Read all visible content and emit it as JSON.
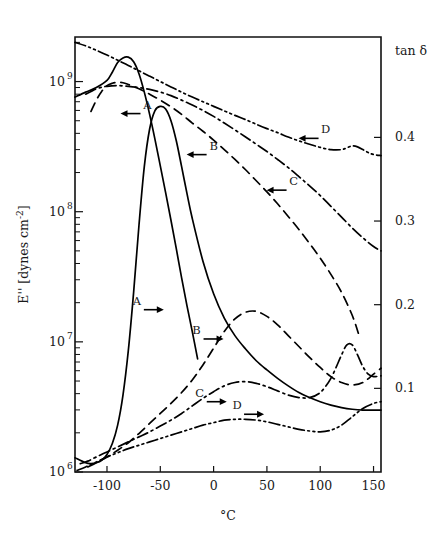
{
  "figure": {
    "background_color": "#ffffff",
    "line_color": "#000000",
    "frame": {
      "left": 75,
      "top": 37,
      "right": 381,
      "bottom": 472
    }
  },
  "chart_data": {
    "type": "line",
    "title": "",
    "subtitle": "",
    "xlabel": "°C",
    "ylabel": "E'' [dynes cm⁻²]",
    "y2label": "tan δ",
    "grid": false,
    "legend_position": "inline-labels-with-arrows",
    "xlim": [
      -130,
      157
    ],
    "xticks": [
      -100,
      -50,
      0,
      50,
      100,
      150
    ],
    "xticklabels": [
      "-100",
      "-50",
      "0",
      "50",
      "100",
      "150"
    ],
    "yscale": "log",
    "ylim": [
      1000000,
      2200000000
    ],
    "yticks": [
      1000000,
      10000000,
      100000000,
      1000000000
    ],
    "yticklabels": [
      "10⁶",
      "10⁷",
      "10⁸",
      "10⁹"
    ],
    "ytick_mantissas": [
      "10",
      "10",
      "10",
      "10"
    ],
    "ytick_exponents": [
      "6",
      "7",
      "8",
      "9"
    ],
    "y2lim": [
      0.0,
      0.52
    ],
    "y2ticks": [
      0.1,
      0.2,
      0.3,
      0.4
    ],
    "y2ticklabels": [
      "0.1",
      "0.2",
      "0.3",
      "0.4"
    ],
    "axis_assignment_note": "Upper set of four curves = E'' (left log axis, arrows point left). Lower set of four curves = tan δ (right linear axis, arrows point right).",
    "series": [
      {
        "name": "A",
        "label": "A",
        "axis": "left",
        "quantity": "E''",
        "linestyle": "solid",
        "arrow_direction": "left",
        "label_position": {
          "x": -62,
          "y": 620000000
        },
        "x": [
          -130,
          -120,
          -110,
          -100,
          -95,
          -90,
          -85,
          -80,
          -75,
          -70,
          -65,
          -60,
          -55,
          -50,
          -45,
          -40,
          -35,
          -30,
          -25,
          -20,
          -15
        ],
        "y": [
          760000000,
          830000000,
          900000000,
          1020000000,
          1180000000,
          1400000000,
          1520000000,
          1540000000,
          1420000000,
          1150000000,
          830000000,
          560000000,
          360000000,
          225000000,
          140000000,
          86000000,
          52000000,
          31000000,
          19000000,
          12000000,
          7400000
        ]
      },
      {
        "name": "B",
        "label": "B",
        "axis": "left",
        "quantity": "E''",
        "linestyle": "dashed",
        "arrow_direction": "left",
        "label_position": {
          "x": 0,
          "y": 300000000
        },
        "x": [
          -115,
          -110,
          -105,
          -100,
          -95,
          -90,
          -85,
          -80,
          -70,
          -60,
          -50,
          -40,
          -30,
          -20,
          -10,
          0,
          10,
          20,
          30,
          40,
          50,
          60,
          70,
          80,
          90,
          100,
          110,
          120,
          130,
          136
        ],
        "y": [
          590000000,
          720000000,
          840000000,
          930000000,
          970000000,
          985000000,
          980000000,
          950000000,
          880000000,
          800000000,
          720000000,
          640000000,
          560000000,
          480000000,
          415000000,
          355000000,
          300000000,
          252000000,
          210000000,
          173000000,
          142000000,
          115000000,
          92000000,
          73000000,
          57000000,
          44000000,
          33000000,
          24000000,
          16000000,
          11500000
        ]
      },
      {
        "name": "C",
        "label": "C",
        "axis": "left",
        "quantity": "E''",
        "linestyle": "dash-dot",
        "arrow_direction": "left",
        "label_position": {
          "x": 75,
          "y": 160000000
        },
        "x": [
          -120,
          -115,
          -110,
          -105,
          -100,
          -90,
          -80,
          -70,
          -60,
          -50,
          -40,
          -30,
          -20,
          -10,
          0,
          10,
          20,
          30,
          40,
          50,
          60,
          70,
          80,
          90,
          100,
          110,
          120,
          130,
          140,
          150,
          157
        ],
        "y": [
          800000000,
          840000000,
          880000000,
          905000000,
          920000000,
          930000000,
          920000000,
          900000000,
          870000000,
          830000000,
          780000000,
          720000000,
          660000000,
          600000000,
          540000000,
          480000000,
          425000000,
          375000000,
          330000000,
          290000000,
          252000000,
          218000000,
          186000000,
          158000000,
          133000000,
          110000000,
          91000000,
          75000000,
          63000000,
          54000000,
          50000000
        ]
      },
      {
        "name": "D",
        "label": "D",
        "axis": "left",
        "quantity": "E''",
        "linestyle": "dash-dot-dot",
        "arrow_direction": "left",
        "label_position": {
          "x": 105,
          "y": 400000000
        },
        "x": [
          -130,
          -120,
          -110,
          -100,
          -90,
          -80,
          -70,
          -60,
          -50,
          -40,
          -30,
          -20,
          -10,
          0,
          10,
          20,
          30,
          40,
          50,
          60,
          70,
          80,
          90,
          100,
          110,
          120,
          125,
          130,
          135,
          140,
          145,
          150,
          157
        ],
        "y": [
          2000000000,
          1880000000,
          1740000000,
          1600000000,
          1460000000,
          1330000000,
          1210000000,
          1100000000,
          1000000000,
          910000000,
          830000000,
          760000000,
          700000000,
          645000000,
          595000000,
          550000000,
          510000000,
          470000000,
          435000000,
          405000000,
          375000000,
          350000000,
          330000000,
          312000000,
          300000000,
          300000000,
          310000000,
          320000000,
          315000000,
          300000000,
          285000000,
          275000000,
          270000000
        ]
      },
      {
        "name": "A",
        "label": "A",
        "axis": "right",
        "quantity": "tan δ",
        "linestyle": "solid",
        "arrow_direction": "right",
        "label_position": {
          "x": -72,
          "y": 0.2
        },
        "x": [
          -130,
          -120,
          -115,
          -110,
          -105,
          -100,
          -95,
          -90,
          -85,
          -80,
          -75,
          -70,
          -65,
          -60,
          -55,
          -50,
          -45,
          -40,
          -35,
          -30,
          -25,
          -20,
          -10,
          0,
          10,
          20,
          30,
          40,
          50,
          60,
          70,
          80,
          90,
          100,
          110,
          120,
          130,
          140,
          150,
          157
        ],
        "y": [
          0.017,
          0.011,
          0.01,
          0.011,
          0.014,
          0.021,
          0.034,
          0.056,
          0.092,
          0.145,
          0.215,
          0.295,
          0.365,
          0.41,
          0.432,
          0.437,
          0.434,
          0.42,
          0.396,
          0.365,
          0.333,
          0.303,
          0.252,
          0.213,
          0.184,
          0.163,
          0.147,
          0.133,
          0.122,
          0.112,
          0.103,
          0.095,
          0.089,
          0.084,
          0.08,
          0.077,
          0.075,
          0.074,
          0.074,
          0.074
        ]
      },
      {
        "name": "B",
        "label": "B",
        "axis": "right",
        "quantity": "tan δ",
        "linestyle": "dashed",
        "arrow_direction": "right",
        "label_position": {
          "x": -16,
          "y": 0.165
        },
        "x": [
          -118,
          -110,
          -100,
          -90,
          -80,
          -70,
          -60,
          -50,
          -40,
          -30,
          -20,
          -10,
          0,
          10,
          20,
          30,
          40,
          50,
          60,
          70,
          80,
          90,
          100,
          110,
          120,
          130,
          140,
          150,
          157
        ],
        "y": [
          0.006,
          0.011,
          0.018,
          0.026,
          0.035,
          0.046,
          0.058,
          0.07,
          0.082,
          0.095,
          0.11,
          0.128,
          0.148,
          0.168,
          0.183,
          0.191,
          0.192,
          0.186,
          0.176,
          0.163,
          0.15,
          0.137,
          0.125,
          0.114,
          0.107,
          0.104,
          0.107,
          0.117,
          0.124
        ]
      },
      {
        "name": "C",
        "label": "C",
        "axis": "right",
        "quantity": "tan δ",
        "linestyle": "dash-dot",
        "arrow_direction": "right",
        "label_position": {
          "x": -13,
          "y": 0.09
        },
        "x": [
          -125,
          -118,
          -110,
          -100,
          -90,
          -80,
          -70,
          -60,
          -50,
          -40,
          -30,
          -20,
          -10,
          0,
          10,
          20,
          30,
          40,
          50,
          60,
          70,
          80,
          90,
          100,
          110,
          120,
          125,
          130,
          135,
          140,
          145,
          150,
          157
        ],
        "y": [
          0.01,
          0.013,
          0.018,
          0.024,
          0.03,
          0.036,
          0.042,
          0.048,
          0.055,
          0.062,
          0.07,
          0.079,
          0.088,
          0.096,
          0.103,
          0.107,
          0.108,
          0.106,
          0.102,
          0.097,
          0.092,
          0.089,
          0.089,
          0.095,
          0.112,
          0.14,
          0.152,
          0.152,
          0.14,
          0.126,
          0.117,
          0.114,
          0.115
        ]
      },
      {
        "name": "D",
        "label": "D",
        "axis": "right",
        "quantity": "tan δ",
        "linestyle": "dash-dot-dot",
        "arrow_direction": "right",
        "label_position": {
          "x": 22,
          "y": 0.075
        },
        "x": [
          -128,
          -120,
          -110,
          -100,
          -90,
          -80,
          -70,
          -60,
          -50,
          -40,
          -30,
          -20,
          -10,
          0,
          10,
          20,
          30,
          40,
          50,
          60,
          70,
          80,
          90,
          100,
          110,
          120,
          130,
          140,
          150,
          157
        ],
        "y": [
          0.002,
          0.006,
          0.012,
          0.018,
          0.023,
          0.028,
          0.032,
          0.036,
          0.04,
          0.044,
          0.048,
          0.052,
          0.056,
          0.059,
          0.062,
          0.063,
          0.063,
          0.062,
          0.06,
          0.057,
          0.054,
          0.051,
          0.049,
          0.048,
          0.05,
          0.056,
          0.066,
          0.076,
          0.082,
          0.084
        ]
      }
    ]
  }
}
